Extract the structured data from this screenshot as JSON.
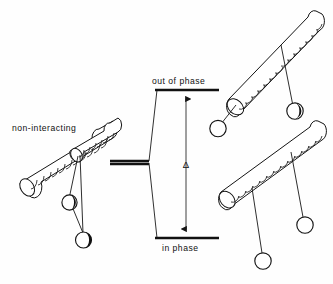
{
  "figure": {
    "kind": "energy-level-splitting-diagram",
    "background_color": "#fefefe",
    "ink_color": "#141414",
    "width": 333,
    "height": 284
  },
  "labels": {
    "non_interacting": "non-interacting",
    "out_of_phase": "out of phase",
    "in_phase": "in phase",
    "splitting": "Δ"
  },
  "levels": {
    "non_interacting": {
      "label_key": "non_interacting",
      "x1": 110,
      "x2": 149,
      "y": 161
    },
    "out_of_phase": {
      "label_key": "out_of_phase",
      "x1": 155,
      "x2": 219,
      "y": 90
    },
    "in_phase": {
      "label_key": "in_phase",
      "x1": 155,
      "x2": 219,
      "y": 238
    }
  },
  "splitting_arrow": {
    "symbol": "Δ",
    "x": 186,
    "y_top": 92,
    "y_bottom": 236,
    "label_x": 186,
    "label_y": 167
  },
  "correlation_lines": [
    {
      "from_x": 149,
      "from_y": 161,
      "to_x": 156,
      "to_y": 90
    },
    {
      "from_x": 149,
      "from_y": 161,
      "to_x": 156,
      "to_y": 238
    }
  ],
  "label_positions": {
    "non_interacting": {
      "x": 12,
      "y": 131
    },
    "out_of_phase": {
      "x": 155,
      "y": 84
    },
    "in_phase": {
      "x": 161,
      "y": 250
    }
  },
  "structures": [
    {
      "name": "non-interacting-molecule",
      "position": "left",
      "description": "single helical rod with two pendant spheres",
      "rods": 1,
      "spheres": 2
    },
    {
      "name": "out-of-phase-dimer",
      "position": "top-right",
      "description": "helical rod with two pendant spheres, antiparallel arrangement",
      "rods": 1,
      "spheres": 2
    },
    {
      "name": "in-phase-dimer",
      "position": "bottom-right",
      "description": "helical rod with two pendant spheres, parallel arrangement",
      "rods": 1,
      "spheres": 2
    }
  ]
}
